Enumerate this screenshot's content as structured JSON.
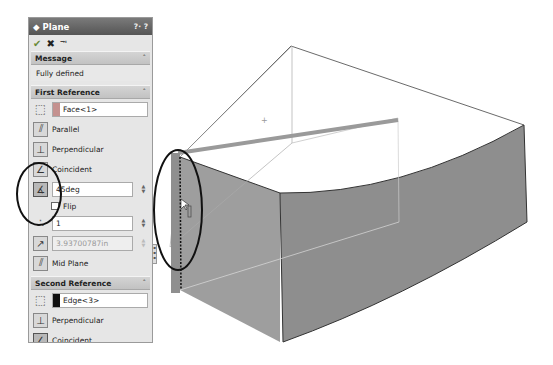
{
  "property_manager": {
    "title": "Plane",
    "help_label": "?· ?",
    "actions": {
      "ok": "✔",
      "cancel": "✖",
      "pin": "⭲"
    },
    "message_group": {
      "label": "Message",
      "text": "Fully defined"
    },
    "first_reference": {
      "label": "First Reference",
      "selection": "Face<1>",
      "selection_color": "#c4918f",
      "options": [
        "Parallel",
        "Perpendicular",
        "Coincident"
      ],
      "angle_value": "45deg",
      "flip_label": "Flip",
      "instances_value": "1",
      "distance_value": "3.93700787in",
      "mid_plane_label": "Mid Plane"
    },
    "second_reference": {
      "label": "Second Reference",
      "selection": "Edge<3>",
      "selection_color": "#111111",
      "options": [
        "Perpendicular",
        "Coincident"
      ]
    }
  },
  "icons": {
    "plane": "◆",
    "cube": "⬚",
    "parallel": "⫽",
    "perpendicular": "⊥",
    "coincident": "∠",
    "angle": "∡",
    "instances": "∴",
    "distance": "↗",
    "mid_plane": "⫽",
    "chevron_up": "˄"
  },
  "colors": {
    "title_bar": "#5f5f5f",
    "panel_bg": "#e6e6e6",
    "part_face": "#8c8c8c",
    "part_face_light": "#a6a6a6",
    "edge_highlight": "#9a9a9a"
  }
}
